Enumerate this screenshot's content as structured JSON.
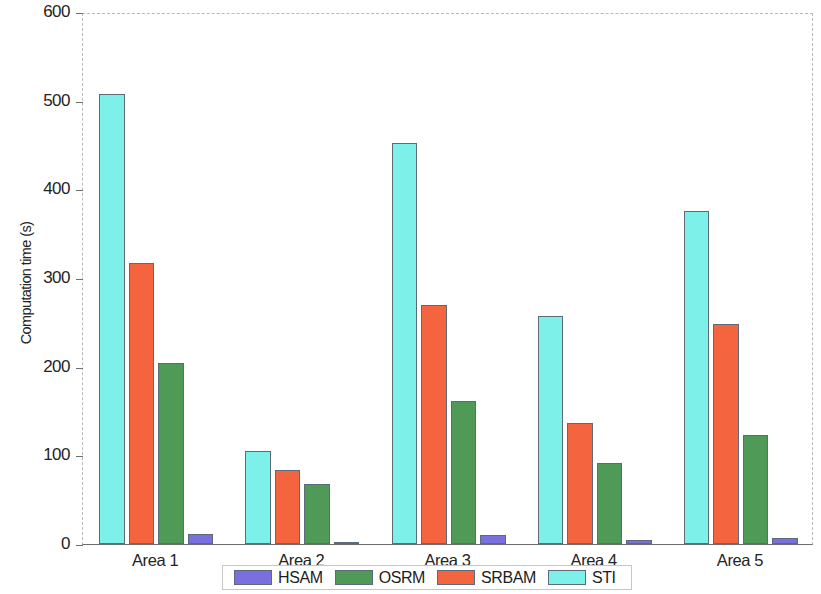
{
  "chart_data": {
    "type": "bar",
    "title": "",
    "xlabel": "",
    "ylabel": "Computation time (s)",
    "categories": [
      "Area 1",
      "Area 2",
      "Area 3",
      "Area 4",
      "Area 5"
    ],
    "series": [
      {
        "name": "HSAM",
        "color": "#7b6fe0",
        "values": [
          11,
          2,
          10,
          4,
          7
        ]
      },
      {
        "name": "OSRM",
        "color": "#4f9a56",
        "values": [
          204,
          68,
          161,
          91,
          123
        ]
      },
      {
        "name": "SRBAM",
        "color": "#f4643e",
        "values": [
          317,
          83,
          270,
          136,
          248
        ]
      },
      {
        "name": "STI",
        "color": "#7ef0ea",
        "values": [
          508,
          105,
          452,
          257,
          376
        ]
      }
    ],
    "bar_draw_order": [
      "STI",
      "SRBAM",
      "OSRM",
      "HSAM"
    ],
    "ylim": [
      0,
      600
    ],
    "yticks": [
      0,
      100,
      200,
      300,
      400,
      500,
      600
    ],
    "ytick_labels": [
      "0",
      "100",
      "200",
      "300",
      "400",
      "500",
      "600"
    ],
    "grid": false,
    "legend_position": "bottom-outside",
    "legend_entries": [
      "HSAM",
      "OSRM",
      "SRBAM",
      "STI"
    ]
  }
}
